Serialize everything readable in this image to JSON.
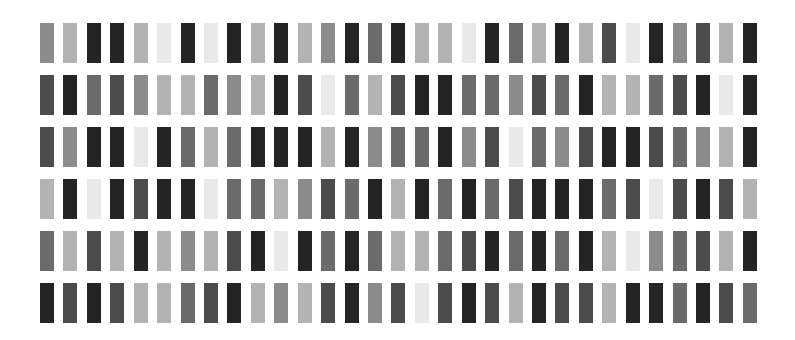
{
  "palette": {
    "K": "#242424",
    "D": "#4c4c4c",
    "G": "#6b6b6b",
    "M": "#8c8c8c",
    "L": "#b3b3b3",
    "E": "#e9e9e9"
  },
  "layout": {
    "x0": 40,
    "pitch": 23.43,
    "row_tops": [
      23,
      75,
      127,
      179,
      231,
      283
    ],
    "bar_width": 14,
    "bar_height": 40
  },
  "rows": [
    "MLKKLEKEKLKLMKGKLLEKGLKLDEKMDLK",
    "DKGDMLLGMLKDEGLDKKGGMDGKLLGDKEK",
    "DMKKEKGLGKKKLKMGGKMDEGMDKKDGMLK",
    "LKEKDKKEGGLMDGKLKGKGDKKKGDEDKDL",
    "GLDLKLMLDKEKGKGLLGDKGKGKLEMGDLK",
    "KDKDLLGDKLMLDKMDEDKDLKDDLKKGKDG"
  ]
}
